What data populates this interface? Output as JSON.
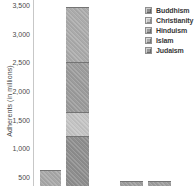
{
  "chart_data": {
    "type": "bar",
    "stacked": true,
    "title": "",
    "ylabel": "Adherents (in millions)",
    "xlabel": "",
    "gridlines": false,
    "legend_position": "top-right",
    "yticks": [
      {
        "label": "3,500",
        "value": 3500
      },
      {
        "label": "3,000",
        "value": 3000
      },
      {
        "label": "2,500",
        "value": 2500
      },
      {
        "label": "2,000",
        "value": 2000
      },
      {
        "label": "1,500",
        "value": 1500
      },
      {
        "label": "1,000",
        "value": 1000
      },
      {
        "label": "500",
        "value": 500
      }
    ],
    "ylim_visible": [
      310,
      3500
    ],
    "crop_note": "Screenshot is cropped: chart title, x-axis, category labels and all values below ~310 million are cut off at the bottom edge.",
    "legend_items": [
      {
        "label": "Buddhism",
        "color": "#8e8e8e"
      },
      {
        "label": "Christianity",
        "color": "#c4c4c4"
      },
      {
        "label": "Hinduism",
        "color": "#9c9c9c"
      },
      {
        "label": "Islam",
        "color": "#ababab"
      },
      {
        "label": "Judaism",
        "color": "#999999"
      }
    ],
    "bars": [
      {
        "slot": 1,
        "top_value": 620,
        "segments": [
          {
            "series": "top segment (lower stack cropped)",
            "from_value": 0,
            "to_value": 620,
            "color": "#a8a8a8"
          }
        ]
      },
      {
        "slot": 2,
        "top_value": 3470,
        "segments": [
          {
            "series": "Buddhism",
            "from_value": 0,
            "to_value": 1220,
            "color": "#8e8e8e"
          },
          {
            "series": "Christianity",
            "from_value": 1220,
            "to_value": 1640,
            "color": "#c4c4c4"
          },
          {
            "series": "Hinduism",
            "from_value": 1640,
            "to_value": 2510,
            "color": "#9c9c9c"
          },
          {
            "series": "Islam",
            "from_value": 2510,
            "to_value": 3470,
            "color": "#ababab"
          }
        ]
      },
      {
        "slot": 4,
        "top_value": 435,
        "segments": [
          {
            "series": "top segment (lower stack cropped)",
            "from_value": 0,
            "to_value": 435,
            "color": "#9e9e9e"
          }
        ]
      },
      {
        "slot": 5,
        "top_value": 430,
        "segments": [
          {
            "series": "top segment (lower stack cropped)",
            "from_value": 0,
            "to_value": 430,
            "color": "#9e9e9e"
          }
        ]
      }
    ]
  }
}
